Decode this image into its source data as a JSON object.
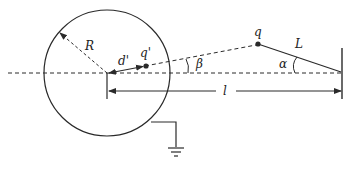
{
  "diagram": {
    "type": "physics-electrostatics-image-charge",
    "labels": {
      "radius": "R",
      "image_distance": "d'",
      "image_charge": "q'",
      "charge": "q",
      "angle_beta": "β",
      "string_length": "L",
      "angle_alpha": "α",
      "distance": "l"
    },
    "colors": {
      "stroke": "#2a2a2a",
      "background": "#ffffff"
    },
    "elements": [
      "grounded conducting sphere of radius R",
      "image charge q' at distance d' from center",
      "charge q suspended by string of length L at angle α",
      "line from center to q makes angle β with axis",
      "distance l from sphere center to wall",
      "ground connection"
    ]
  }
}
